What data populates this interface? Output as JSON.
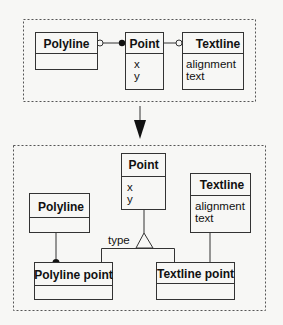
{
  "top_panel": {
    "classes": [
      {
        "name": "Polyline",
        "attributes": []
      },
      {
        "name": "Point",
        "attributes": [
          "x",
          "y"
        ]
      },
      {
        "name": "Textline",
        "attributes": [
          "alignment",
          "text"
        ]
      }
    ],
    "associations": [
      {
        "from": "Polyline",
        "to": "Point",
        "from_end": "hollow-circle",
        "to_end": "filled-circle"
      },
      {
        "from": "Point",
        "to": "Textline",
        "from_end": "none",
        "to_end": "hollow-circle"
      }
    ]
  },
  "arrow": {
    "direction": "down"
  },
  "bottom_panel": {
    "classes": [
      {
        "name": "Point",
        "attributes": [
          "x",
          "y"
        ]
      },
      {
        "name": "Textline",
        "attributes": [
          "alignment",
          "text"
        ]
      },
      {
        "name": "Polyline",
        "attributes": []
      },
      {
        "name": "Polyline point",
        "attributes": []
      },
      {
        "name": "Textline point",
        "attributes": []
      }
    ],
    "generalization": {
      "parent": "Point",
      "children": [
        "Polyline point",
        "Textline point"
      ],
      "discriminator": "type"
    },
    "associations": [
      {
        "from": "Polyline",
        "to": "Polyline point",
        "to_end": "filled-circle"
      },
      {
        "from": "Textline",
        "to": "Textline point",
        "to_end": "none"
      }
    ]
  }
}
